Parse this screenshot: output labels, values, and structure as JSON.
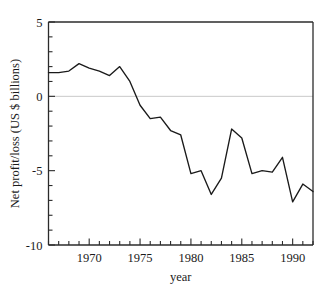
{
  "chart_data": {
    "type": "line",
    "title": "",
    "subtitle": "",
    "xlabel": "year",
    "ylabel": "Net profit/loss (US $ billions)",
    "xlim": [
      1966,
      1992
    ],
    "ylim": [
      -10,
      5
    ],
    "grid": false,
    "legend": false,
    "legend_position": "none",
    "zero_reference_line": true,
    "x_tick_labels": [
      "1970",
      "1975",
      "1980",
      "1985",
      "1990"
    ],
    "x_tick_values": [
      1970,
      1975,
      1980,
      1985,
      1990
    ],
    "x_minor_tick_interval": 1,
    "y_tick_labels": [
      "5",
      "0",
      "-5",
      "-10"
    ],
    "y_tick_values": [
      5,
      0,
      -5,
      -10
    ],
    "y_minor_tick_interval": 1,
    "x": [
      1966,
      1967,
      1968,
      1969,
      1970,
      1971,
      1972,
      1973,
      1974,
      1975,
      1976,
      1977,
      1978,
      1979,
      1980,
      1981,
      1982,
      1983,
      1984,
      1985,
      1986,
      1987,
      1988,
      1989,
      1990,
      1991,
      1992
    ],
    "values": [
      1.6,
      1.6,
      1.7,
      2.2,
      1.9,
      1.7,
      1.4,
      2.0,
      1.0,
      -0.6,
      -1.5,
      -1.4,
      -2.3,
      -2.6,
      -5.2,
      -5.0,
      -6.6,
      -5.5,
      -2.2,
      -2.8,
      -5.2,
      -5.0,
      -5.1,
      -4.1,
      -7.1,
      -5.9,
      -6.4
    ],
    "series": [
      {
        "name": "Net profit/loss",
        "color": "#1a1a1a",
        "values": [
          1.6,
          1.6,
          1.7,
          2.2,
          1.9,
          1.7,
          1.4,
          2.0,
          1.0,
          -0.6,
          -1.5,
          -1.4,
          -2.3,
          -2.6,
          -5.2,
          -5.0,
          -6.6,
          -5.5,
          -2.2,
          -2.8,
          -5.2,
          -5.0,
          -5.1,
          -4.1,
          -7.1,
          -5.9,
          -6.4
        ]
      }
    ]
  },
  "colors": {
    "axis": "#2b2b2b",
    "series": "#1a1a1a",
    "zero_line": "#c9c9c9",
    "background": "#ffffff"
  }
}
